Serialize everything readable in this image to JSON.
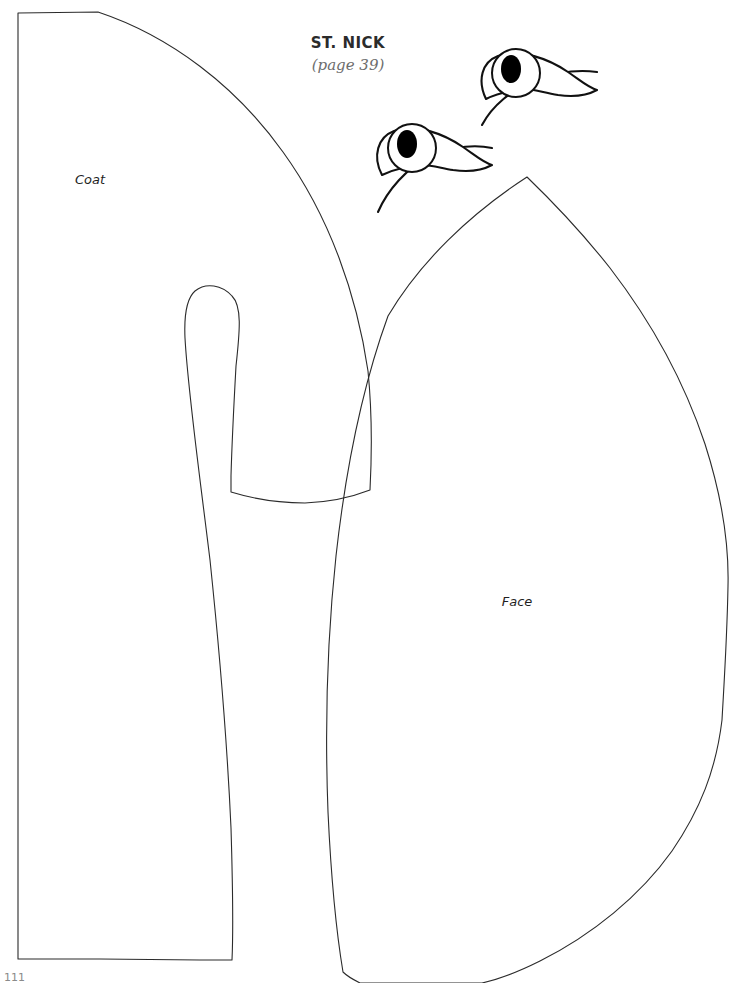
{
  "page": {
    "background_color": "#ffffff",
    "ink_color": "#2b2b2b",
    "title": "ST. NICK",
    "subtitle": "(page 39)",
    "folio": "111"
  },
  "labels": {
    "coat": "Coat",
    "face": "Face"
  },
  "pieces": [
    {
      "name": "coat",
      "label": "Coat",
      "label_x": 90,
      "label_y": 184,
      "outline": "M 18 13 L 98 12 C 170 36 236 86 283 152 C 330 217 357 296 368 371 C 372 411 372 452 370 490 C 352 497 330 502 305 503 C 280 503 254 499 231 492 L 231 476 C 232 440 234 402 236 366 C 240 330 242 306 232 296 C 222 285 206 282 195 291 C 186 299 184 316 185 338 C 188 392 199 470 210 560 C 219 646 227 740 231 828 C 233 894 233 938 232 960 L 200 960 L 100 959 L 18 959 Z",
      "inner_cutouts": []
    },
    {
      "name": "face",
      "label": "Face",
      "label_x": 517,
      "label_y": 601,
      "outline": "M 527 177 C 556 205 584 235 610 268 C 650 320 684 381 705 444 C 722 497 729 546 728 586 C 727 640 724 684 722 720 C 716 770 700 810 672 851 C 640 896 592 935 540 961 C 520 971 500 979 482 983 L 360 983 C 352 979 347 976 343 972 C 336 930 331 876 328 812 C 325 732 327 640 336 556 C 346 466 364 382 388 316 C 420 262 470 214 527 177 Z",
      "inner_cutouts": []
    }
  ],
  "eyes": [
    {
      "name": "eye-upper",
      "lid_outline": "M 486 99 C 477 80 482 62 498 56 C 520 48 549 59 568 72 C 581 81 589 88 597 90 C 586 96 572 97 558 95 C 546 93 536 90 528 89 C 513 90 496 94 486 99 Z",
      "lash_sweep": "M 482 125 C 492 106 512 89 536 80 C 560 71 582 70 597 72",
      "iris_cx": 516,
      "iris_cy": 73,
      "iris_r": 24,
      "pupil_cx": 511,
      "pupil_cy": 69,
      "pupil_rx": 10,
      "pupil_ry": 14
    },
    {
      "name": "eye-lower",
      "lid_outline": "M 382 175 C 372 156 378 137 394 131 C 416 123 444 134 463 147 C 476 156 484 163 492 165 C 481 171 467 172 453 170 C 441 168 431 165 423 165 C 409 166 392 170 382 175 Z",
      "lash_sweep": "M 378 212 C 387 191 407 167 431 156 C 455 145 478 145 492 148",
      "iris_cx": 412,
      "iris_cy": 148,
      "iris_r": 24,
      "pupil_cx": 407,
      "pupil_cy": 144,
      "pupil_rx": 10,
      "pupil_ry": 14
    }
  ]
}
